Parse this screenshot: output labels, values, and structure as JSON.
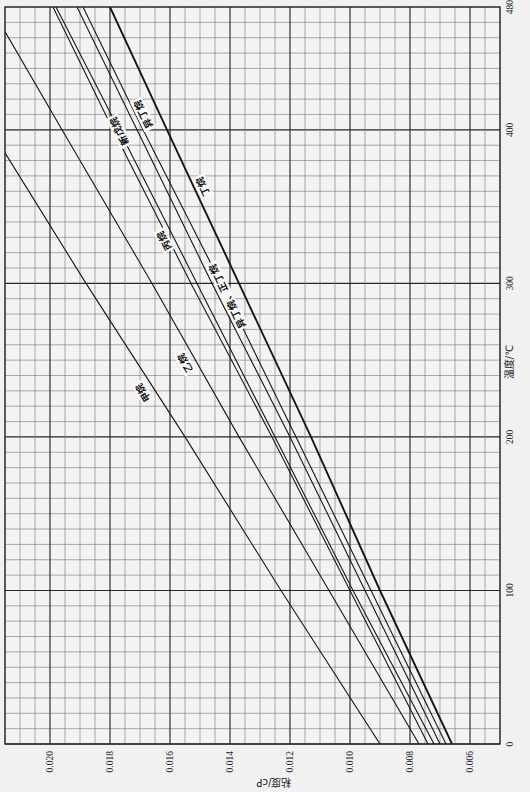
{
  "chart_data": {
    "type": "line",
    "title": "",
    "xlabel": "温度/℃",
    "ylabel": "粘度/cP",
    "xlim": [
      0,
      480
    ],
    "ylim": [
      0.005,
      0.0215
    ],
    "xticks": [
      0,
      100,
      200,
      300,
      400,
      480
    ],
    "xtick_labels": [
      "0",
      "100",
      "200",
      "300",
      "400",
      "480"
    ],
    "yticks": [
      0.02,
      0.018,
      0.016,
      0.014,
      0.012,
      0.01,
      0.008,
      0.006
    ],
    "ytick_labels": [
      "0.020",
      "0.018",
      "0.016",
      "0.014",
      "0.012",
      "0.010",
      "0.008",
      "0.006"
    ],
    "grid": {
      "on": true,
      "x_minor": 10,
      "x_major": 100,
      "y_minor": 0.0005,
      "y_major": 0.002
    },
    "legend": "none (curves labeled inline)",
    "orientation": "figure rotated 90° counter-clockwise (temperature axis on right, viscosity axis along bottom)",
    "series": [
      {
        "name": "甲烷",
        "points": [
          [
            0,
            0.009
          ],
          [
            100,
            0.0123
          ],
          [
            200,
            0.0155
          ],
          [
            300,
            0.0188
          ],
          [
            385,
            0.0215
          ]
        ]
      },
      {
        "name": "乙烷",
        "points": [
          [
            0,
            0.0077
          ],
          [
            100,
            0.0107
          ],
          [
            200,
            0.0137
          ],
          [
            300,
            0.0166
          ],
          [
            400,
            0.0196
          ],
          [
            464,
            0.0215
          ]
        ]
      },
      {
        "name": "丙烷",
        "points": [
          [
            0,
            0.0074
          ],
          [
            100,
            0.01
          ],
          [
            200,
            0.0126
          ],
          [
            300,
            0.0153
          ],
          [
            400,
            0.0179
          ],
          [
            480,
            0.0199
          ]
        ]
      },
      {
        "name": "新戊烷",
        "points": [
          [
            0,
            0.0072
          ],
          [
            100,
            0.0099
          ],
          [
            200,
            0.0125
          ],
          [
            300,
            0.0151
          ],
          [
            400,
            0.0177
          ],
          [
            480,
            0.0198
          ]
        ]
      },
      {
        "name": "异丁烷",
        "points": [
          [
            0,
            0.007
          ],
          [
            100,
            0.0095
          ],
          [
            200,
            0.012
          ],
          [
            300,
            0.0146
          ],
          [
            400,
            0.0171
          ],
          [
            480,
            0.0191
          ]
        ]
      },
      {
        "name": "正丁烷",
        "points": [
          [
            0,
            0.0068
          ],
          [
            100,
            0.0093
          ],
          [
            200,
            0.0118
          ],
          [
            300,
            0.0143
          ],
          [
            400,
            0.0169
          ],
          [
            480,
            0.0189
          ]
        ]
      },
      {
        "name": "丁烷",
        "points": [
          [
            0,
            0.0066
          ],
          [
            100,
            0.009
          ],
          [
            200,
            0.0113
          ],
          [
            300,
            0.0137
          ],
          [
            400,
            0.0161
          ],
          [
            480,
            0.018
          ]
        ]
      }
    ],
    "annotations": [
      {
        "text": "甲烷",
        "x": 229,
        "y": 0.0169,
        "on": "甲烷"
      },
      {
        "text": "乙烷",
        "x": 248,
        "y": 0.0155,
        "on": "乙烷"
      },
      {
        "text": "丙烷",
        "x": 328,
        "y": 0.0162,
        "on": "丙烷"
      },
      {
        "text": "新戊烷",
        "x": 399,
        "y": 0.0177,
        "on": "新戊烷"
      },
      {
        "text": "异丁烷",
        "x": 410,
        "y": 0.0169,
        "on": "异丁烷"
      },
      {
        "text": "丁烷",
        "x": 363,
        "y": 0.0149,
        "on": "丁烷"
      },
      {
        "text": "异丁烷、正丁烷",
        "x": 292,
        "y": 0.0141,
        "on": "正丁烷"
      }
    ]
  }
}
